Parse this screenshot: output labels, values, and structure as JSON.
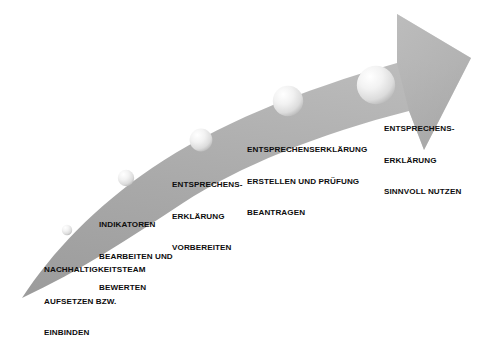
{
  "diagram": {
    "type": "curved-upward-arrow-process",
    "orientation": "ascending left-to-right",
    "background_color": "#ffffff",
    "arrow_color": "#a8a8a8",
    "arrow_color_light": "#c0c0c0",
    "arrow_color_dark": "#8f8f8f",
    "sphere_color": "#e8e8e8",
    "text_color": "#0d0d0d",
    "title": "",
    "steps": [
      {
        "index": 1,
        "lines": [
          "NACHHALTIGKEITSTEAM",
          "AUFSETZEN BZW.",
          "EINBINDEN"
        ],
        "marker": "sphere-1",
        "marker_size": "xsmall"
      },
      {
        "index": 2,
        "lines": [
          "INDIKATOREN",
          "BEARBEITEN UND",
          "BEWERTEN"
        ],
        "marker": "sphere-2",
        "marker_size": "small"
      },
      {
        "index": 3,
        "lines": [
          "ENTSPRECHENS-",
          "ERKLÄRUNG",
          "VORBEREITEN"
        ],
        "marker": "sphere-3",
        "marker_size": "medium"
      },
      {
        "index": 4,
        "lines": [
          "ENTSPRECHENSERKLÄRUNG",
          "ERSTELLEN UND PRÜFUNG",
          "BEANTRAGEN"
        ],
        "marker": "sphere-4",
        "marker_size": "large"
      },
      {
        "index": 5,
        "lines": [
          "ENTSPRECHENS-",
          "ERKLÄRUNG",
          "SINNVOLL NUTZEN"
        ],
        "marker": "sphere-5",
        "marker_size": "xlarge"
      }
    ]
  }
}
